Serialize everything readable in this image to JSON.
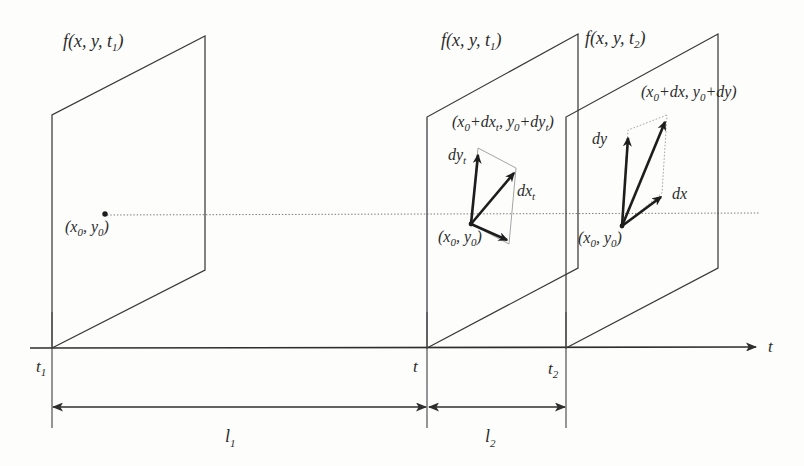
{
  "figure": {
    "background_color": "#fdfdfc",
    "ink_color": "#2b2b2b"
  },
  "axis": {
    "label": "t",
    "name": "time-axis",
    "arrow": "right",
    "baseline_y": 348,
    "start_x": 30,
    "end_x": 762
  },
  "ticks": [
    {
      "label": "t",
      "sub": "1",
      "x": 52,
      "name": "tick-t1"
    },
    {
      "label": "t",
      "sub": "",
      "x": 427,
      "name": "tick-t"
    },
    {
      "label": "t",
      "sub": "2",
      "x": 566,
      "name": "tick-t2"
    }
  ],
  "planes": [
    {
      "id": "plane-t1",
      "function_label": {
        "f": "f",
        "args": "(x, y, t",
        "sub": "1",
        "close": ")"
      },
      "origin_point": {
        "x0": "(x",
        "sub0": "0",
        "comma": ", y",
        "sub1": "0",
        "close": ")"
      },
      "has_vectors": false
    },
    {
      "id": "plane-t",
      "function_label": {
        "f": "f",
        "args": "(x, y, t",
        "sub": "1",
        "close": ")"
      },
      "origin_point": {
        "x0": "(x",
        "sub0": "0",
        "comma": ", y",
        "sub1": "0",
        "close": ")"
      },
      "has_vectors": true,
      "tip_label": {
        "pre": "(x",
        "sub0": "0",
        "mid": "+dx",
        "subt1": "t",
        "comma": ", y",
        "sub1": "0",
        "mid2": "+dy",
        "subt2": "t",
        "close": ")"
      },
      "vector_dy": {
        "label": "dy",
        "sub": "t"
      },
      "vector_dx": {
        "label": "dx",
        "sub": "t"
      }
    },
    {
      "id": "plane-t2",
      "function_label": {
        "f": "f",
        "args": "(x, y, t",
        "sub": "2",
        "close": ")"
      },
      "origin_point": {
        "x0": "(x",
        "sub0": "0",
        "comma": ", y",
        "sub1": "0",
        "close": ")"
      },
      "has_vectors": true,
      "tip_label": {
        "pre": "(x",
        "sub0": "0",
        "mid": "+dx",
        "subt1": "",
        "comma": ", y",
        "sub1": "0",
        "mid2": "+dy",
        "subt2": "",
        "close": ")"
      },
      "vector_dy": {
        "label": "dy",
        "sub": ""
      },
      "vector_dx": {
        "label": "dx",
        "sub": ""
      }
    }
  ],
  "dimensions": [
    {
      "id": "dim-l1",
      "label": "l",
      "sub": "1",
      "from_x": 52,
      "to_x": 427,
      "y": 407,
      "label_x": 232,
      "label_y": 440
    },
    {
      "id": "dim-l2",
      "label": "l",
      "sub": "2",
      "from_x": 427,
      "to_x": 566,
      "y": 407,
      "label_x": 492,
      "label_y": 440
    }
  ]
}
